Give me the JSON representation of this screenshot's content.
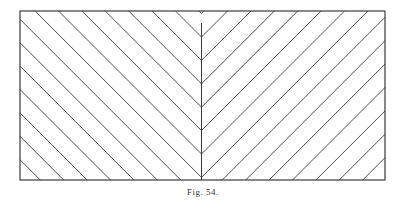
{
  "figure": {
    "type": "herringbone-hatching",
    "caption": "Fig. 54.",
    "line_color": "#3a3a3a",
    "background": "#ffffff",
    "hatch_lines_per_side": 14
  }
}
